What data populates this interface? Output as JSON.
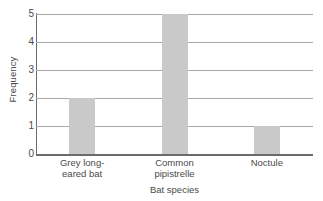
{
  "chart_data": {
    "type": "bar",
    "title": "",
    "xlabel": "Bat species",
    "ylabel": "Frequency",
    "categories": [
      "Grey long-\neared bat",
      "Common\npipistrelle",
      "Noctule"
    ],
    "values": [
      2,
      5,
      1
    ],
    "ylim": [
      0,
      5
    ],
    "yticks": [
      0,
      1,
      2,
      3,
      4,
      5
    ],
    "ytick_labels": [
      "0",
      "1",
      "2",
      "3",
      "4",
      "5"
    ],
    "grid": true,
    "legend": false,
    "bar_color": "#c9c9c9",
    "grid_color": "#a9a9a9",
    "axis_color": "#6b6b6b",
    "text_color": "#4a4a4a"
  }
}
